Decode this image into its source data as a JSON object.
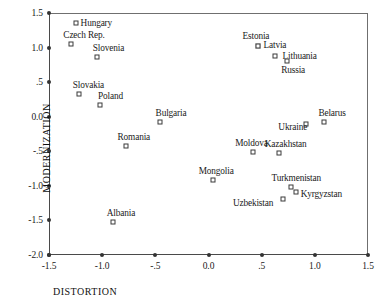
{
  "chart_data": {
    "type": "scatter",
    "title": "",
    "xlabel": "DISTORTION",
    "ylabel": "MODERNIZATION",
    "xlim": [
      -1.5,
      1.5
    ],
    "ylim": [
      -2.0,
      1.5
    ],
    "grid": false,
    "legend": "none",
    "xticks": [
      -1.5,
      -1.0,
      -0.5,
      0.0,
      0.5,
      1.0,
      1.5
    ],
    "xtick_labels": [
      "-1.5",
      "-1.0",
      "-.5",
      "0.0",
      ".5",
      "1.0",
      "1.5"
    ],
    "yticks": [
      1.5,
      1.0,
      0.5,
      0.0,
      -0.5,
      -1.0,
      -1.5,
      -2.0
    ],
    "ytick_labels": [
      "1.5",
      "1.0",
      ".5",
      "0.0",
      "-.5",
      "-1.0",
      "-1.5",
      "-2.0"
    ],
    "points": [
      {
        "label": "Hungary",
        "x": -1.25,
        "y": 1.35,
        "label_dx": 5,
        "label_dy": -4
      },
      {
        "label": "Czech Rep.",
        "x": -1.29,
        "y": 1.05,
        "label_dx": -8,
        "label_dy": -13
      },
      {
        "label": "Slovenia",
        "x": -1.05,
        "y": 0.86,
        "label_dx": -4,
        "label_dy": -13
      },
      {
        "label": "Slovakia",
        "x": -1.22,
        "y": 0.33,
        "label_dx": -6,
        "label_dy": -13
      },
      {
        "label": "Poland",
        "x": -1.02,
        "y": 0.17,
        "label_dx": -2,
        "label_dy": -13
      },
      {
        "label": "Bulgaria",
        "x": -0.46,
        "y": -0.07,
        "label_dx": -4,
        "label_dy": -13
      },
      {
        "label": "Romania",
        "x": -0.78,
        "y": -0.42,
        "label_dx": -8,
        "label_dy": -13
      },
      {
        "label": "Albania",
        "x": -0.9,
        "y": -1.52,
        "label_dx": -6,
        "label_dy": -13
      },
      {
        "label": "Estonia",
        "x": 0.47,
        "y": 1.02,
        "label_dx": -16,
        "label_dy": -14
      },
      {
        "label": "Latvia",
        "x": 0.47,
        "y": 1.02,
        "label_dx": 5,
        "label_dy": -5
      },
      {
        "label": "Lithuania",
        "x": 0.63,
        "y": 0.88,
        "label_dx": 7,
        "label_dy": -4
      },
      {
        "label": "Russia",
        "x": 0.74,
        "y": 0.81,
        "label_dx": -6,
        "label_dy": 5
      },
      {
        "label": "Belarus",
        "x": 1.09,
        "y": -0.08,
        "label_dx": -6,
        "label_dy": -13
      },
      {
        "label": "Ukraine",
        "x": 0.92,
        "y": -0.1,
        "label_dx": -28,
        "label_dy": -1
      },
      {
        "label": "Moldova",
        "x": 0.42,
        "y": -0.51,
        "label_dx": -18,
        "label_dy": -13
      },
      {
        "label": "Kazakhstan",
        "x": 0.66,
        "y": -0.52,
        "label_dx": -14,
        "label_dy": -13
      },
      {
        "label": "Mongolia",
        "x": 0.04,
        "y": -0.92,
        "label_dx": -14,
        "label_dy": -13
      },
      {
        "label": "Turkmenistan",
        "x": 0.78,
        "y": -1.01,
        "label_dx": -20,
        "label_dy": -13
      },
      {
        "label": "Kyrgyzstan",
        "x": 0.82,
        "y": -1.09,
        "label_dx": 5,
        "label_dy": -2
      },
      {
        "label": "Uzbekistan",
        "x": 0.7,
        "y": -1.19,
        "label_dx": -50,
        "label_dy": 0
      }
    ]
  }
}
